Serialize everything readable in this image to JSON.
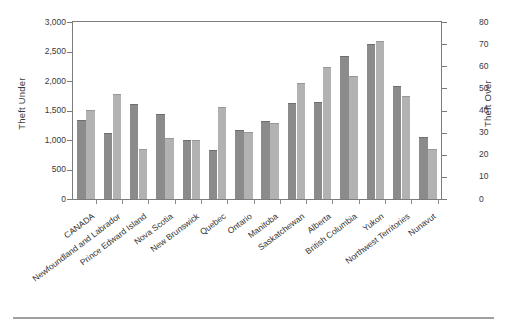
{
  "chart_data": {
    "type": "bar",
    "title": "",
    "subtitle": "",
    "xlabel": "",
    "ylabel": "Theft Under",
    "y2label": "Theft Over",
    "grid": false,
    "legend": "none",
    "ylim": [
      0,
      3000
    ],
    "y2lim": [
      0,
      80
    ],
    "yticks": [
      "0",
      "500",
      "1,000",
      "1,500",
      "2,000",
      "2,500",
      "3,000"
    ],
    "ytick_values": [
      0,
      500,
      1000,
      1500,
      2000,
      2500,
      3000
    ],
    "y2ticks": [
      "0",
      "10",
      "20",
      "30",
      "40",
      "50",
      "60",
      "70",
      "80"
    ],
    "y2tick_values": [
      0,
      10,
      20,
      30,
      40,
      50,
      60,
      70,
      80
    ],
    "categories": [
      "CANADA",
      "Newfoundland and Labrador",
      "Prince Edward Island",
      "Nova Scotia",
      "New Brunswick",
      "Quebec",
      "Ontario",
      "Manitoba",
      "Saskatchewan",
      "Alberta",
      "British Columbia",
      "Yukon",
      "Northwest Territories",
      "Nunavut"
    ],
    "series": [
      {
        "name": "Theft Under",
        "axis": "left",
        "color": "#8b8b8b",
        "values": [
          1320,
          1110,
          1600,
          1420,
          990,
          820,
          1150,
          1300,
          1610,
          1620,
          2400,
          2610,
          1900,
          1030
        ]
      },
      {
        "name": "Theft Over",
        "axis": "right",
        "color": "#b2b2b2",
        "values": [
          40,
          47,
          22,
          27,
          26,
          41,
          30,
          34,
          52,
          59,
          55,
          71,
          46,
          22
        ]
      }
    ]
  },
  "colors": {
    "series_1": "#8b8b8b",
    "series_2": "#b2b2b2",
    "axis": "#7c7c7c",
    "text": "#3a3a3a",
    "background": "#ffffff"
  }
}
